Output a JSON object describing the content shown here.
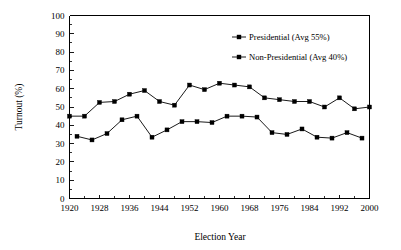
{
  "chart_data": {
    "type": "line",
    "title": "",
    "xlabel": "Election Year",
    "ylabel": "Turnout (%)",
    "xlim": [
      1920,
      2000
    ],
    "ylim": [
      0,
      100
    ],
    "grid": false,
    "legend_position": "top-right",
    "x_ticks": [
      1920,
      1928,
      1936,
      1944,
      1952,
      1960,
      1968,
      1976,
      1984,
      1992,
      2000
    ],
    "x_tick_labels": [
      "1920",
      "1928",
      "1936",
      "1944",
      "1952",
      "1960",
      "1968",
      "1976",
      "1984",
      "1992",
      "2000"
    ],
    "x_minor_ticks": [
      1924,
      1932,
      1940,
      1948,
      1956,
      1964,
      1972,
      1980,
      1988,
      1996
    ],
    "y_ticks": [
      0,
      10,
      20,
      30,
      40,
      50,
      60,
      70,
      80,
      90,
      100
    ],
    "y_tick_labels": [
      "0",
      "10",
      "20",
      "30",
      "40",
      "50",
      "60",
      "70",
      "80",
      "90",
      "100"
    ],
    "series": [
      {
        "name": "Presidential (Avg 55%)",
        "marker": "square",
        "x": [
          1920,
          1924,
          1928,
          1932,
          1936,
          1940,
          1944,
          1948,
          1952,
          1956,
          1960,
          1964,
          1968,
          1972,
          1976,
          1980,
          1984,
          1988,
          1992,
          1996,
          2000
        ],
        "values": [
          45,
          45,
          52.5,
          53,
          57,
          59,
          53,
          51,
          62,
          59.5,
          63,
          62,
          61,
          55,
          54,
          53,
          53,
          50,
          55,
          49,
          50
        ]
      },
      {
        "name": "Non-Presidential (Avg 40%)",
        "marker": "square",
        "x": [
          1922,
          1926,
          1930,
          1934,
          1938,
          1942,
          1946,
          1950,
          1954,
          1958,
          1962,
          1966,
          1970,
          1974,
          1978,
          1982,
          1986,
          1990,
          1994,
          1998
        ],
        "values": [
          34,
          32,
          35.5,
          43,
          45,
          33.5,
          37.5,
          42,
          42,
          41.5,
          45,
          45,
          44.5,
          36,
          35,
          38,
          33.5,
          33,
          36,
          33
        ]
      }
    ],
    "legend": [
      {
        "label": "Presidential (Avg 55%)",
        "avg": 55
      },
      {
        "label": "Non-Presidential (Avg 40%)",
        "avg": 40
      }
    ]
  },
  "colors": {
    "axis": "#000000",
    "series_1": "#000000",
    "series_2": "#000000",
    "background": "#ffffff"
  }
}
